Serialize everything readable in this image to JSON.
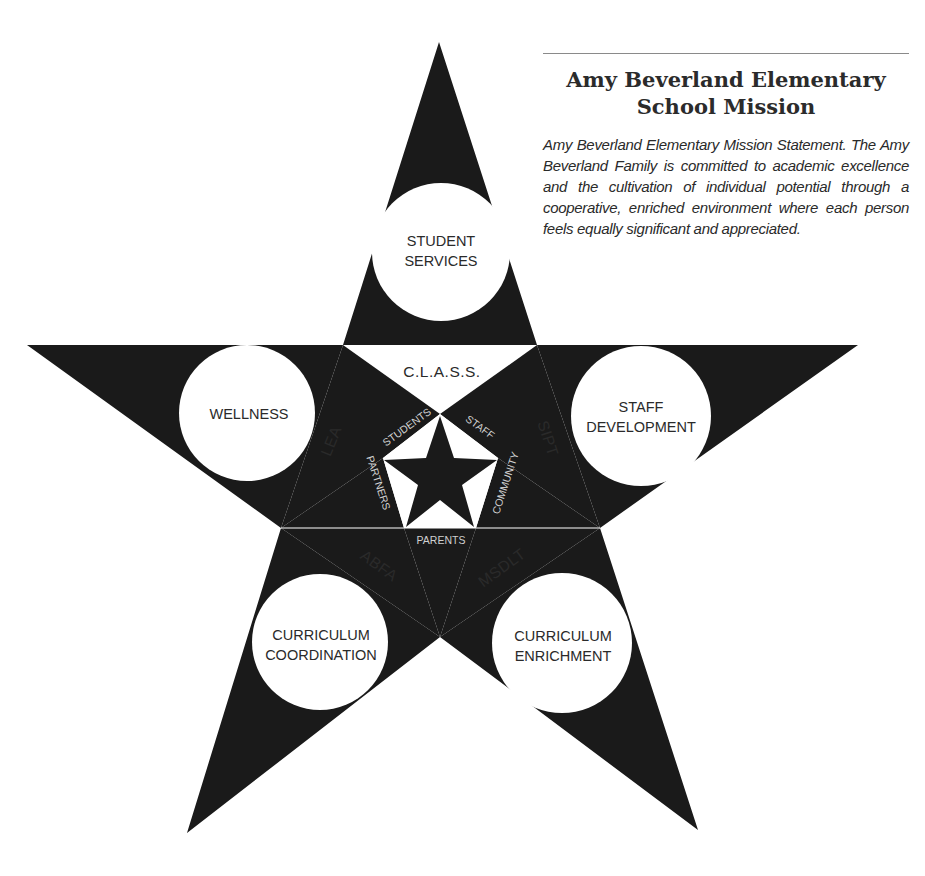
{
  "mission": {
    "title": "Amy Beverland Elementary School Mission",
    "statement": "Amy Beverland Elementary Mission Statement. The Amy Beverland Family is committed to academic excellence and the cultivation of individual potential through a cooperative, enriched environment where each person feels equally significant and appreciated."
  },
  "diagram": {
    "colors": {
      "fill": "#1a1a1a",
      "background": "#ffffff",
      "inner_text": "#d0d0d0"
    },
    "outer_points": {
      "top": {
        "line1": "STUDENT",
        "line2": "SERVICES"
      },
      "left": {
        "line1": "WELLNESS",
        "line2": ""
      },
      "right": {
        "line1": "STAFF",
        "line2": "DEVELOPMENT"
      },
      "bottom_left": {
        "line1": "CURRICULUM",
        "line2": "COORDINATION"
      },
      "bottom_right": {
        "line1": "CURRICULUM",
        "line2": "ENRICHMENT"
      }
    },
    "bands": {
      "top": "C.L.A.S.S.",
      "left": "LEA",
      "right": "SIPT",
      "bottom_left": "ABFA",
      "bottom_right": "MSDLT"
    },
    "inner_groups": {
      "upper_left": "STUDENTS",
      "upper_right": "STAFF",
      "right": "COMMUNITY",
      "bottom": "PARENTS",
      "left": "PARTNERS"
    }
  }
}
